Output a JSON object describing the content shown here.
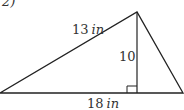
{
  "problem": {
    "number_label": "2)"
  },
  "figure": {
    "type": "triangle",
    "labels": {
      "left_side": {
        "value": "13",
        "unit": "in"
      },
      "height": {
        "value": "10",
        "unit": ""
      },
      "base": {
        "value": "18",
        "unit": "in"
      }
    },
    "right_angle_marker": true,
    "stroke_color": "#222222"
  }
}
